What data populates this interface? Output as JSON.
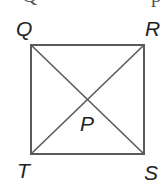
{
  "figure": {
    "type": "geometry-diagram",
    "clipped_top_text": {
      "left": "Q",
      "right": "p"
    },
    "shape": {
      "name": "square",
      "vertices": {
        "Q": {
          "x": 31,
          "y": 45
        },
        "R": {
          "x": 144,
          "y": 45
        },
        "S": {
          "x": 144,
          "y": 154
        },
        "T": {
          "x": 31,
          "y": 154
        }
      },
      "diagonals": [
        "QS",
        "RT"
      ],
      "intersection": {
        "label": "P",
        "x": 87.5,
        "y": 99.5
      }
    },
    "labels": {
      "Q": "Q",
      "R": "R",
      "S": "S",
      "T": "T",
      "P": "P"
    },
    "colors": {
      "stroke": "#5a5a5a",
      "label": "#222222",
      "background": "#ffffff"
    }
  }
}
